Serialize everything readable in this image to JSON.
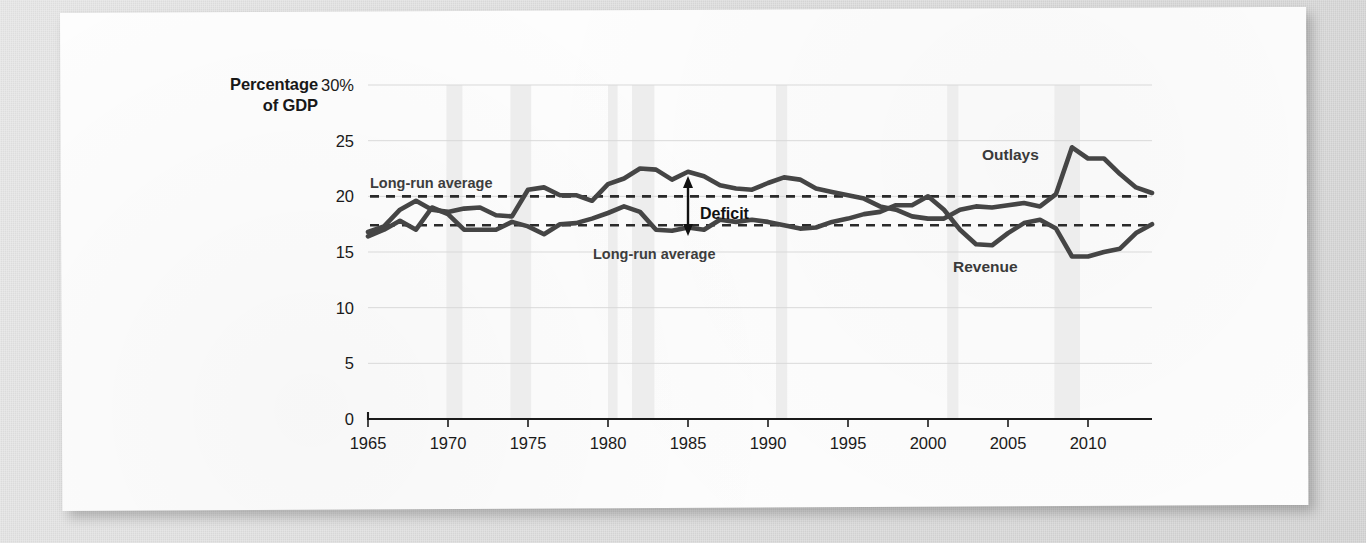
{
  "figure": {
    "axis_title_line1": "Percentage",
    "axis_title_line2": "of GDP",
    "outlays_label": "Outlays",
    "revenue_label": "Revenue",
    "deficit_label": "Deficit",
    "longrun_label_top": "Long-run average",
    "longrun_label_bottom": "Long-run average"
  },
  "colors": {
    "line": "#454545",
    "dashed_average": "#2a2a2a",
    "recession_band": "#ededed",
    "gridline": "#d9d9d9",
    "axis": "#1b1b1b",
    "page": "#fdfdfd",
    "backdrop": "#d9d9d9"
  },
  "chart_data": {
    "type": "line",
    "title": "",
    "subtitle": "",
    "xlabel": "",
    "ylabel": "Percentage of GDP",
    "xlim": [
      1965,
      2014
    ],
    "ylim": [
      0,
      30
    ],
    "grid": true,
    "legend_position": "inline-annotations",
    "yticks": [
      "30%",
      "25",
      "20",
      "15",
      "10",
      "5",
      "0"
    ],
    "ytick_values": [
      30,
      25,
      20,
      15,
      10,
      5,
      0
    ],
    "xticks": [
      "1965",
      "1970",
      "1975",
      "1980",
      "1985",
      "1990",
      "1995",
      "2000",
      "2005",
      "2010"
    ],
    "xtick_values": [
      1965,
      1970,
      1975,
      1980,
      1985,
      1990,
      1995,
      2000,
      2005,
      2010
    ],
    "x": [
      1965,
      1966,
      1967,
      1968,
      1969,
      1970,
      1971,
      1972,
      1973,
      1974,
      1975,
      1976,
      1977,
      1978,
      1979,
      1980,
      1981,
      1982,
      1983,
      1984,
      1985,
      1986,
      1987,
      1988,
      1989,
      1990,
      1991,
      1992,
      1993,
      1994,
      1995,
      1996,
      1997,
      1998,
      1999,
      2000,
      2001,
      2002,
      2003,
      2004,
      2005,
      2006,
      2007,
      2008,
      2009,
      2010,
      2011,
      2012,
      2013,
      2014
    ],
    "series": [
      {
        "name": "Outlays",
        "values": [
          16.8,
          17.3,
          18.8,
          19.6,
          18.8,
          18.6,
          18.9,
          19.0,
          18.3,
          18.2,
          20.6,
          20.8,
          20.1,
          20.1,
          19.6,
          21.1,
          21.6,
          22.5,
          22.4,
          21.5,
          22.2,
          21.8,
          21.0,
          20.7,
          20.6,
          21.2,
          21.7,
          21.5,
          20.7,
          20.4,
          20.1,
          19.8,
          19.1,
          18.8,
          18.2,
          18.0,
          18.0,
          18.8,
          19.1,
          19.0,
          19.2,
          19.4,
          19.1,
          20.2,
          24.4,
          23.4,
          23.4,
          22.0,
          20.8,
          20.3
        ]
      },
      {
        "name": "Revenue",
        "values": [
          16.4,
          17.0,
          17.8,
          17.0,
          19.0,
          18.4,
          17.0,
          17.0,
          17.0,
          17.7,
          17.3,
          16.6,
          17.5,
          17.6,
          18.0,
          18.5,
          19.1,
          18.6,
          17.0,
          16.9,
          17.2,
          17.0,
          17.9,
          17.7,
          17.9,
          17.7,
          17.4,
          17.1,
          17.2,
          17.7,
          18.0,
          18.4,
          18.6,
          19.2,
          19.2,
          20.0,
          18.8,
          17.0,
          15.7,
          15.6,
          16.7,
          17.6,
          17.9,
          17.1,
          14.6,
          14.6,
          15.0,
          15.3,
          16.7,
          17.5
        ]
      }
    ],
    "reference_lines": [
      {
        "label": "Long-run average",
        "series": "Outlays",
        "value": 20.0,
        "style": "dashed"
      },
      {
        "label": "Long-run average",
        "series": "Revenue",
        "value": 17.4,
        "style": "dashed"
      }
    ],
    "annotations": [
      {
        "text": "Outlays",
        "x": 2007,
        "y": 25.4
      },
      {
        "text": "Revenue",
        "x": 2005,
        "y": 13.2
      },
      {
        "text": "Deficit",
        "x": 1986,
        "y": 18.6
      },
      {
        "text": "Long-run average",
        "x": 1968,
        "y": 21.2
      },
      {
        "text": "Long-run average",
        "x": 1986,
        "y": 15.6
      }
    ],
    "recession_bands": [
      {
        "start": 1969.9,
        "end": 1970.9
      },
      {
        "start": 1973.9,
        "end": 1975.2
      },
      {
        "start": 1980.0,
        "end": 1980.6
      },
      {
        "start": 1981.5,
        "end": 1982.9
      },
      {
        "start": 1990.5,
        "end": 1991.2
      },
      {
        "start": 2001.2,
        "end": 2001.9
      },
      {
        "start": 2007.9,
        "end": 2009.5
      }
    ]
  }
}
